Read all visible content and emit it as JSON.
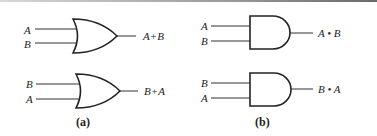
{
  "figure": {
    "panels": [
      {
        "caption": "(a)",
        "gate_type": "OR",
        "gates": [
          {
            "inputs": [
              "A",
              "B"
            ],
            "output": "A+B"
          },
          {
            "inputs": [
              "B",
              "A"
            ],
            "output": "B+A"
          }
        ]
      },
      {
        "caption": "(b)",
        "gate_type": "AND",
        "gates": [
          {
            "inputs": [
              "A",
              "B"
            ],
            "output": "A • B"
          },
          {
            "inputs": [
              "B",
              "A"
            ],
            "output": "B • A"
          }
        ]
      }
    ]
  }
}
